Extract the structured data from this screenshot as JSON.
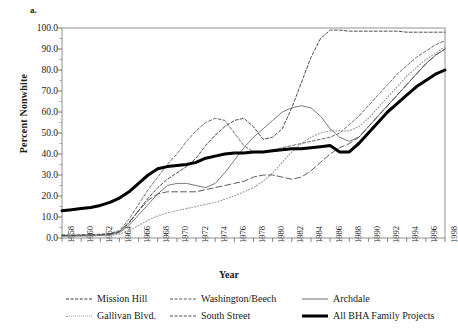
{
  "panel_label": "a.",
  "axes": {
    "ylabel": "Percent Nonwhite",
    "xlabel": "Year",
    "ytick_labels": [
      "100.0",
      "90.0",
      "80.0",
      "70.0",
      "60.0",
      "50.0",
      "40.0",
      "30.0",
      "20.0",
      "10.0",
      "0.0"
    ],
    "xtick_labels": [
      "1958",
      "1960",
      "1962",
      "1964",
      "1966",
      "1968",
      "1970",
      "1972",
      "1974",
      "1976",
      "1978",
      "1980",
      "1982",
      "1984",
      "1986",
      "1988",
      "1990",
      "1992",
      "1994",
      "1996",
      "1998"
    ]
  },
  "legend": {
    "items": [
      {
        "label": "Mission Hill",
        "style": "sw-dash"
      },
      {
        "label": "Washington/Beech",
        "style": "sw-dash2"
      },
      {
        "label": "Archdale",
        "style": "sw-solid"
      },
      {
        "label": "Gallivan Blvd.",
        "style": "sw-dot"
      },
      {
        "label": "South Street",
        "style": "sw-longdash"
      },
      {
        "label": "All BHA Family Projects",
        "style": "sw-thick"
      }
    ]
  },
  "chart_data": {
    "type": "line",
    "title": "",
    "xlabel": "Year",
    "ylabel": "Percent Nonwhite",
    "xlim": [
      1958,
      1998
    ],
    "ylim": [
      0,
      100
    ],
    "grid": false,
    "legend_position": "below",
    "x": [
      1958,
      1959,
      1960,
      1961,
      1962,
      1963,
      1964,
      1965,
      1966,
      1967,
      1968,
      1969,
      1970,
      1971,
      1972,
      1973,
      1974,
      1975,
      1976,
      1977,
      1978,
      1979,
      1980,
      1981,
      1982,
      1983,
      1984,
      1985,
      1986,
      1987,
      1988,
      1989,
      1990,
      1991,
      1992,
      1993,
      1994,
      1995,
      1996,
      1997,
      1998
    ],
    "series": [
      {
        "name": "Mission Hill",
        "color": "#3a3a3a",
        "dash": "dashed",
        "values": [
          1.0,
          1.0,
          1.2,
          1.3,
          1.5,
          2.0,
          3.0,
          7.0,
          13.0,
          19.0,
          24.0,
          28.0,
          31.0,
          34.0,
          38.0,
          44.0,
          49.0,
          53.0,
          56.0,
          57.0,
          53.0,
          47.0,
          48.0,
          52.0,
          62.0,
          74.0,
          86.0,
          95.0,
          99.0,
          99.0,
          98.5,
          98.5,
          98.5,
          98.5,
          98.5,
          98.5,
          98.0,
          98.0,
          98.0,
          98.0,
          98.0
        ]
      },
      {
        "name": "Washington/Beech",
        "color": "#5a5a5a",
        "dash": "dashed",
        "values": [
          1.5,
          1.5,
          1.6,
          1.7,
          1.8,
          2.2,
          3.5,
          9.0,
          16.0,
          23.0,
          29.0,
          35.0,
          40.0,
          46.0,
          51.0,
          55.0,
          57.0,
          56.0,
          50.0,
          44.0,
          41.0,
          41.0,
          42.0,
          43.0,
          44.0,
          45.0,
          46.0,
          47.0,
          48.0,
          50.0,
          54.0,
          58.0,
          63.0,
          68.0,
          73.0,
          78.0,
          82.0,
          86.0,
          89.0,
          92.0,
          94.0
        ]
      },
      {
        "name": "Archdale",
        "color": "#6a6a6a",
        "dash": "solid",
        "values": [
          1.0,
          1.0,
          1.0,
          1.1,
          1.2,
          1.5,
          2.5,
          6.0,
          11.0,
          16.0,
          21.0,
          25.0,
          26.0,
          26.0,
          25.0,
          24.0,
          26.0,
          31.0,
          37.0,
          43.0,
          48.0,
          52.0,
          56.0,
          60.0,
          62.0,
          63.0,
          62.0,
          58.0,
          52.0,
          48.0,
          46.0,
          48.0,
          53.0,
          58.0,
          63.0,
          68.0,
          73.0,
          78.0,
          83.0,
          87.0,
          90.0
        ]
      },
      {
        "name": "Gallivan Blvd.",
        "color": "#9a9a9a",
        "dash": "dotted",
        "values": [
          1.0,
          1.0,
          1.0,
          1.0,
          1.1,
          1.2,
          1.8,
          3.5,
          6.0,
          8.5,
          10.5,
          12.0,
          13.0,
          14.0,
          15.0,
          16.0,
          17.0,
          18.5,
          20.0,
          22.0,
          24.0,
          27.0,
          31.0,
          36.0,
          41.0,
          45.0,
          48.0,
          50.0,
          51.0,
          51.0,
          51.0,
          53.0,
          57.0,
          62.0,
          67.0,
          72.0,
          77.0,
          81.0,
          85.0,
          88.0,
          91.0
        ]
      },
      {
        "name": "South Street",
        "color": "#4a4a4a",
        "dash": "longdash",
        "values": [
          1.2,
          1.2,
          1.3,
          1.4,
          1.5,
          1.8,
          3.0,
          7.5,
          13.0,
          18.0,
          21.0,
          22.0,
          22.0,
          22.0,
          22.0,
          23.0,
          24.0,
          25.0,
          26.0,
          27.0,
          29.0,
          30.0,
          30.0,
          29.0,
          28.0,
          29.0,
          32.0,
          36.0,
          40.0,
          43.0,
          45.0,
          48.0,
          53.0,
          58.0,
          63.0,
          68.0,
          73.0,
          78.0,
          83.0,
          87.0,
          90.0
        ]
      },
      {
        "name": "All BHA Family Projects",
        "color": "#000000",
        "dash": "solid-thick",
        "values": [
          13.0,
          13.5,
          14.0,
          14.5,
          15.5,
          17.0,
          19.0,
          22.0,
          26.0,
          30.0,
          33.0,
          34.0,
          34.5,
          35.0,
          36.0,
          38.0,
          39.0,
          40.0,
          40.5,
          40.5,
          41.0,
          41.0,
          41.5,
          42.0,
          42.5,
          42.5,
          43.0,
          43.5,
          44.0,
          41.0,
          41.0,
          45.0,
          50.0,
          55.0,
          60.0,
          64.0,
          68.0,
          72.0,
          75.0,
          78.0,
          80.0
        ]
      }
    ]
  }
}
